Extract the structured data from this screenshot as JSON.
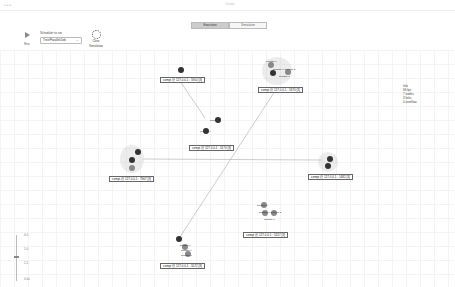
{
  "window": {
    "title": "Cluster",
    "dots": "● ● ●"
  },
  "tabs": [
    {
      "label": "Execution",
      "active": true
    },
    {
      "label": "Simulation",
      "active": false
    }
  ],
  "toolbar": {
    "run_label": "Run",
    "scheduler_label": "Scheduler to run",
    "scheduler_value": "Tree/Parallel/Job",
    "reset_label_1": "Clear",
    "reset_label_2": "Simulation"
  },
  "nodes": [
    {
      "id": "n1",
      "label": "compt @ 127.0.0.1 : 5950 [3]",
      "x": 160,
      "y": 77
    },
    {
      "id": "n2",
      "label": "compt @ 127.0.0.1 : 5370 [3]",
      "x": 258,
      "y": 87
    },
    {
      "id": "n3",
      "label": "compt @ 127.0.0.1 : 5170 [3]",
      "x": 189,
      "y": 145
    },
    {
      "id": "n4",
      "label": "compt @ 127.0.0.1 : 7967 [3]",
      "x": 109,
      "y": 176
    },
    {
      "id": "n5",
      "label": "compt @ 127.0.0.1 : 1482 [3]",
      "x": 308,
      "y": 174
    },
    {
      "id": "n6",
      "label": "compt @ 127.0.0.1 : 5257 [3]",
      "x": 243,
      "y": 232
    },
    {
      "id": "n7",
      "label": "compt @ 127.0.0.1 : 5572 [3]",
      "x": 160,
      "y": 263
    }
  ],
  "sublabels": {
    "n2": [
      "subtask 0",
      "subtask 1 subtask 2",
      "subtask 3"
    ],
    "n3": [
      "subtask 0",
      "subtask 1"
    ],
    "n6": [
      "subtask 0",
      "subtask 1 subtask 2",
      "subtask 3"
    ],
    "n7": [
      "subtask 0",
      "subtask 1",
      "subtask 2"
    ]
  },
  "legend": {
    "title": "Info",
    "items": [
      "96 fps",
      "7 nodes",
      "3 links",
      "0 overflow"
    ]
  },
  "zoom_ticks": [
    "0.5",
    "1.0",
    "1.5",
    "0.0x"
  ]
}
